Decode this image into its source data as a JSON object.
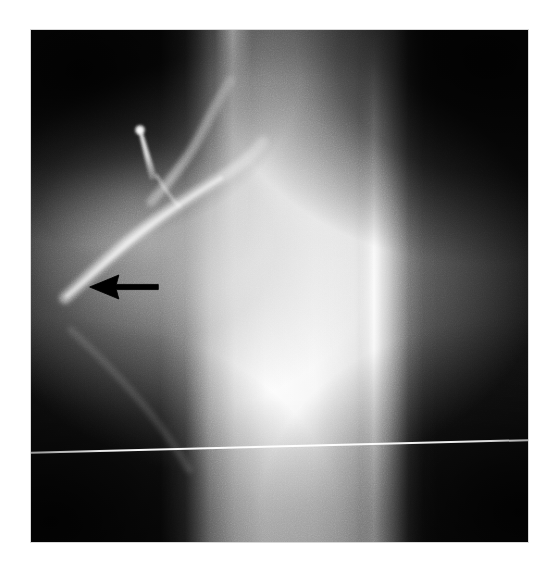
{
  "figure": {
    "kind": "radiograph",
    "modality": "X-ray",
    "caption": "",
    "background_color": "#ffffff",
    "plate": {
      "left": 31,
      "top": 30,
      "width": 497,
      "height": 512,
      "base_color": "#070707",
      "border_color": "#d9d9d9"
    }
  },
  "annotations": [
    {
      "id": "lesion-arrow",
      "type": "arrow",
      "direction": "left",
      "color": "#000000",
      "label": "",
      "tip_x": 88,
      "tip_y": 287,
      "tail_x": 160,
      "tail_y": 287
    }
  ],
  "features": [
    {
      "id": "bone-shaft",
      "label": "bright vertical bone shaft",
      "tone": "#ffffff"
    },
    {
      "id": "cortex-line-left",
      "label": "left cortical margin line",
      "tone": "#ffffff"
    },
    {
      "id": "cortex-line-right",
      "label": "right cortical margin line",
      "tone": "#ffffff"
    },
    {
      "id": "periosteal-rim",
      "label": "curved periosteal rim",
      "tone": "#e8e8e8"
    },
    {
      "id": "bone-spicule",
      "label": "thin bright bone spicule",
      "tone": "#ffffff"
    },
    {
      "id": "soft-tissue-mass",
      "label": "soft tissue shadow at lesion",
      "tone": "#9a9a9a"
    },
    {
      "id": "scan-line",
      "label": "horizontal scan line artefact",
      "tone": "#ffffff"
    }
  ],
  "text_overlays": []
}
